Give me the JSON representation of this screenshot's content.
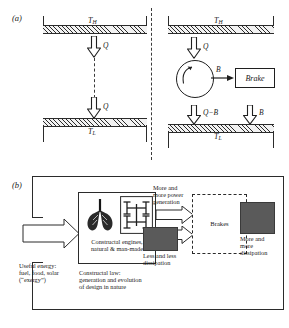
{
  "figure": {
    "panel_a_tag": "(a)",
    "panel_b_tag": "(b)"
  },
  "panel_a": {
    "left": {
      "hot_reservoir_label": "T",
      "hot_reservoir_sub": "H",
      "cold_reservoir_label": "T",
      "cold_reservoir_sub": "L",
      "heat_in_label": "Q",
      "heat_out_label": "Q"
    },
    "right": {
      "hot_reservoir_label": "T",
      "hot_reservoir_sub": "H",
      "cold_reservoir_label": "T",
      "cold_reservoir_sub": "L",
      "heat_in_label": "Q",
      "work_label": "B",
      "brake_label": "Brake",
      "heat_rejected_label": "Q−B",
      "brake_dissipation_label": "B"
    }
  },
  "panel_b": {
    "input_label": "Useful energy:\nfuel, food, solar\n(“exergy”)",
    "engines_caption": "Constructal engines,\nnatural & man-made",
    "law_caption": "Constructal law:\ngeneration and evolution\nof design in nature",
    "power_label": "More and\nmore power\ngeneration",
    "dissipation_low_label": "Less and less\ndissipation",
    "brakes_label": "Brakes",
    "dissipation_high_label": "More and\nmore\ndissipation",
    "icon_lung": "lung-icon",
    "icon_tree": "constructal-tree-icon"
  },
  "colors": {
    "ink": "#1a1a1a",
    "line": "#2b2b2b",
    "gray_block": "#5a5a5a",
    "hatch_bg": "#f2f2f2"
  }
}
